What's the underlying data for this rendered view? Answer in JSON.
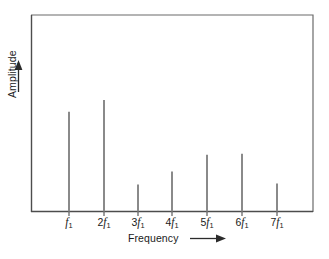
{
  "chart_data": {
    "type": "bar",
    "title": "",
    "subtitle": "",
    "xlabel": "Frequency",
    "ylabel": "Amplitude",
    "xlabel_arrow": "right-arrow",
    "ylabel_arrow": "up-arrow",
    "categories": [
      "f₁",
      "2f₁",
      "3f₁",
      "4f₁",
      "5f₁",
      "6f₁",
      "7f₁"
    ],
    "tick_labels": [
      {
        "coefficient": "",
        "symbol": "f",
        "subscript": "1"
      },
      {
        "coefficient": "2",
        "symbol": "f",
        "subscript": "1"
      },
      {
        "coefficient": "3",
        "symbol": "f",
        "subscript": "1"
      },
      {
        "coefficient": "4",
        "symbol": "f",
        "subscript": "1"
      },
      {
        "coefficient": "5",
        "symbol": "f",
        "subscript": "1"
      },
      {
        "coefficient": "6",
        "symbol": "f",
        "subscript": "1"
      },
      {
        "coefficient": "7",
        "symbol": "f",
        "subscript": "1"
      }
    ],
    "values": [
      0.507,
      0.568,
      0.137,
      0.203,
      0.289,
      0.294,
      0.142
    ],
    "ylim": [
      0,
      1
    ],
    "xlim": [
      0,
      8
    ],
    "grid": false,
    "legend": null,
    "axis_ticks_y": [],
    "colors": {
      "line": "#8a8a8a",
      "axis": "#4d4d4d",
      "frame": "#6b6b6b",
      "text": "#1a1a1a",
      "background": "#ffffff"
    }
  }
}
